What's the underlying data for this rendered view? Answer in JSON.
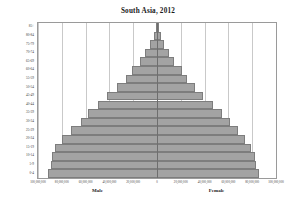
{
  "chart_data": {
    "type": "bar",
    "title": "South Asia, 2012",
    "subtitle": "",
    "xlabel": "",
    "ylabel": "",
    "orientation": "horizontal",
    "layout": "population-pyramid",
    "grid": true,
    "legend_position": "none",
    "bar_color": "#a3a3a3",
    "bar_border_color": "#7d7d7d",
    "gridline_color": "#c9c9c9",
    "axis_color": "#6e6e6e",
    "xlim": [
      -100000000,
      100000000
    ],
    "x_ticks": [
      -100000000,
      -80000000,
      -60000000,
      -40000000,
      -20000000,
      0,
      20000000,
      40000000,
      60000000,
      80000000,
      100000000
    ],
    "x_tick_labels": [
      "100,000,000",
      "80,000,000",
      "60,000,000",
      "40,000,000",
      "20,000,000",
      "0",
      "20,000,000",
      "40,000,000",
      "60,000,000",
      "80,000,000",
      "100,000,000"
    ],
    "side_labels": {
      "left": "Male",
      "right": "Female"
    },
    "categories": [
      "0-4",
      "5-9",
      "10-14",
      "15-19",
      "20-24",
      "25-29",
      "30-34",
      "35-39",
      "40-44",
      "45-49",
      "50-54",
      "55-59",
      "60-64",
      "65-69",
      "70-74",
      "75-79",
      "80-84",
      "85+"
    ],
    "series": [
      {
        "name": "Male",
        "values": [
          92000000,
          89000000,
          88000000,
          86000000,
          80000000,
          72000000,
          64000000,
          58000000,
          50000000,
          42000000,
          34000000,
          26000000,
          21000000,
          14000000,
          10000000,
          5500000,
          2600000,
          1100000
        ]
      },
      {
        "name": "Female",
        "values": [
          86000000,
          83000000,
          82000000,
          79000000,
          74000000,
          68000000,
          61000000,
          55000000,
          47000000,
          39000000,
          32000000,
          25000000,
          21000000,
          14500000,
          10500000,
          6000000,
          3000000,
          1400000
        ]
      }
    ]
  }
}
